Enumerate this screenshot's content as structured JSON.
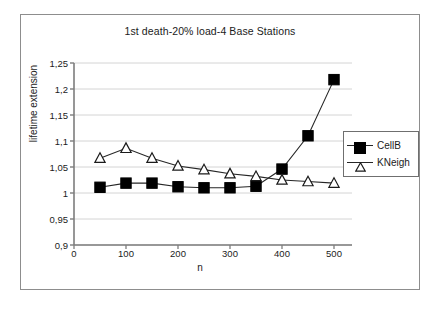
{
  "chart_data": {
    "type": "line",
    "title": "1st death-20% load-4 Base Stations",
    "xlabel": "n",
    "ylabel": "lifetime extension",
    "x": [
      50,
      100,
      150,
      200,
      250,
      300,
      350,
      400,
      450,
      500
    ],
    "series": [
      {
        "name": "CellB",
        "marker": "filled-square",
        "color": "#000000",
        "values": [
          1.011,
          1.019,
          1.019,
          1.012,
          1.01,
          1.01,
          1.013,
          1.046,
          1.11,
          1.218
        ]
      },
      {
        "name": "KNeigh",
        "marker": "open-triangle",
        "color": "#000000",
        "values": [
          1.067,
          1.086,
          1.067,
          1.052,
          1.045,
          1.037,
          1.032,
          1.025,
          1.022,
          1.019
        ]
      }
    ],
    "xlim": [
      0,
      520
    ],
    "ylim": [
      0.9,
      1.25
    ],
    "xticks": [
      0,
      100,
      200,
      300,
      400,
      500
    ],
    "xtick_labels": [
      "0",
      "100",
      "200",
      "300",
      "400",
      "500"
    ],
    "yticks": [
      0.9,
      0.95,
      1.0,
      1.05,
      1.1,
      1.15,
      1.2,
      1.25
    ],
    "ytick_labels": [
      "0,9",
      "0,95",
      "1",
      "1,05",
      "1,1",
      "1,15",
      "1,2",
      "1,25"
    ],
    "grid": "horizontal",
    "grid_color": "#d4d4d4",
    "legend_position": "right",
    "legend": [
      "CellB",
      "KNeigh"
    ],
    "axis_color": "#7d7d7d",
    "line_color": "#262626",
    "background": "#ffffff",
    "border_color": "#8d8d8d"
  }
}
